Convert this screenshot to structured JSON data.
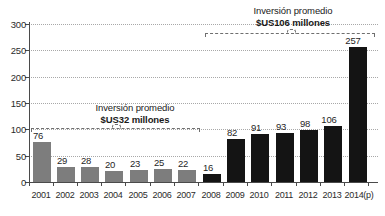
{
  "chart_data": {
    "type": "bar",
    "title": "",
    "xlabel": "",
    "ylabel": "",
    "ylim": [
      0,
      300
    ],
    "ytick_values": [
      0,
      50,
      100,
      150,
      200,
      250,
      300
    ],
    "ytick_labels": [
      "0",
      "50",
      "100",
      "150",
      "200",
      "250",
      "300"
    ],
    "grid": true,
    "legend": "none",
    "categories": [
      "2001",
      "2002",
      "2003",
      "2004",
      "2005",
      "2006",
      "2007",
      "2008",
      "2009",
      "2010",
      "2011",
      "2012",
      "2013",
      "2014(p)"
    ],
    "values": [
      76,
      29,
      28,
      20,
      23,
      25,
      22,
      16,
      82,
      91,
      93,
      98,
      106,
      257
    ],
    "value_labels": [
      "76",
      "29",
      "28",
      "20",
      "23",
      "25",
      "22",
      "16",
      "82",
      "91",
      "93",
      "98",
      "106",
      "257"
    ],
    "bar_colors": [
      "gray",
      "gray",
      "gray",
      "gray",
      "gray",
      "gray",
      "gray",
      "black",
      "black",
      "black",
      "black",
      "black",
      "black",
      "black"
    ],
    "palette": {
      "gray": "#7d7d7d",
      "black": "#141414",
      "gridline": "#a8a8a8",
      "axis": "#4a4a4a",
      "text": "#1a1a1a",
      "background": "#ffffff"
    },
    "annotations": [
      {
        "id": "avg-2001-2007",
        "line1": "Inversión promedio",
        "line2": "$US32 millones",
        "average_value": 32,
        "span_categories": [
          "2001",
          "2007"
        ]
      },
      {
        "id": "avg-2008-2014",
        "line1": "Inversión promedio",
        "line2": "$US106 millones",
        "average_value": 106,
        "span_categories": [
          "2008",
          "2014(p)"
        ]
      }
    ]
  }
}
